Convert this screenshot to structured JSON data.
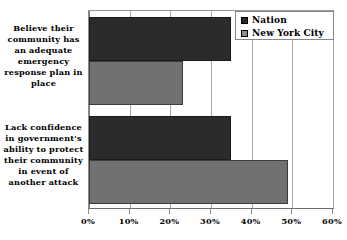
{
  "chart_data": {
    "type": "bar",
    "orientation": "horizontal",
    "title": "",
    "subtitle": "",
    "xlabel": "",
    "ylabel": "",
    "categories": [
      "Believe their community has an adequate emergency response plan in place",
      "Lack confidence in government's ability to protect their community in event of another attack"
    ],
    "category_lines": [
      [
        "Believe their",
        "community has",
        "an adequate",
        "emergency",
        "response plan in",
        "place"
      ],
      [
        "Lack confidence",
        "in government's",
        "ability to protect",
        "their community",
        "in event of",
        "another attack"
      ]
    ],
    "series": [
      {
        "name": "Nation",
        "color": "#2b2b2b",
        "values": [
          35,
          35
        ]
      },
      {
        "name": "New York City",
        "color": "#717171",
        "values": [
          23,
          49
        ]
      }
    ],
    "xlim": [
      0,
      60
    ],
    "xticks": [
      0,
      10,
      20,
      30,
      40,
      50,
      60
    ],
    "xtick_labels": [
      "0%",
      "10%",
      "20%",
      "30%",
      "40%",
      "50%",
      "60%"
    ],
    "grid": true,
    "grid_axis": "x",
    "legend": {
      "position": "top-right",
      "entries": [
        "Nation",
        "New York City"
      ]
    }
  },
  "legend": {
    "entries": [
      {
        "label": "Nation",
        "swatch": "legend-swatch-nation"
      },
      {
        "label": "New York City",
        "swatch": "legend-swatch-new-york-city"
      }
    ]
  },
  "icons": {
    "nation_swatch": "square-swatch-icon",
    "nyc_swatch": "square-swatch-icon"
  }
}
